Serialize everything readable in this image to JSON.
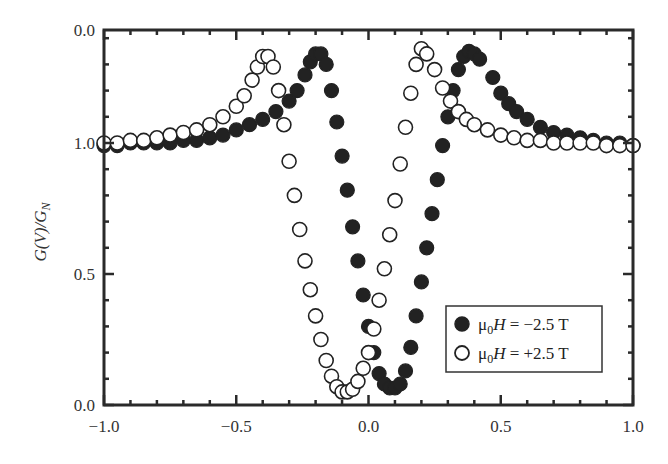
{
  "chart_data": {
    "type": "scatter",
    "title": "",
    "xlabel": "",
    "ylabel": "G(V)/G_N",
    "xlim": [
      -1.0,
      1.0
    ],
    "ylim": [
      0.0,
      1.43
    ],
    "grid": false,
    "legend_position": "lower right",
    "x_ticks": [
      {
        "value": -1.0,
        "label": "−1.0"
      },
      {
        "value": -0.5,
        "label": "−0.5"
      },
      {
        "value": 0.0,
        "label": "0.0"
      },
      {
        "value": 0.5,
        "label": "0.5"
      },
      {
        "value": 1.0,
        "label": "1.0"
      }
    ],
    "y_ticks": [
      {
        "value": 0.0,
        "label": "0.0"
      },
      {
        "value": 0.5,
        "label": "0.5"
      },
      {
        "value": 1.0,
        "label": "1.0"
      },
      {
        "value": 1.43,
        "label": "0.0"
      }
    ],
    "series": [
      {
        "name": "μ0H = −2.5 T",
        "marker": "filled-circle",
        "color": "#222222",
        "x": [
          -1.0,
          -0.95,
          -0.9,
          -0.85,
          -0.8,
          -0.75,
          -0.7,
          -0.65,
          -0.6,
          -0.55,
          -0.5,
          -0.45,
          -0.4,
          -0.35,
          -0.3,
          -0.27,
          -0.24,
          -0.22,
          -0.2,
          -0.18,
          -0.16,
          -0.14,
          -0.12,
          -0.1,
          -0.08,
          -0.06,
          -0.04,
          -0.02,
          0.0,
          0.02,
          0.04,
          0.06,
          0.08,
          0.1,
          0.12,
          0.14,
          0.16,
          0.18,
          0.2,
          0.22,
          0.24,
          0.26,
          0.28,
          0.3,
          0.32,
          0.34,
          0.36,
          0.38,
          0.4,
          0.42,
          0.47,
          0.5,
          0.53,
          0.56,
          0.6,
          0.65,
          0.7,
          0.75,
          0.8,
          0.85,
          0.9,
          0.95,
          1.0
        ],
        "y": [
          0.99,
          0.99,
          1.0,
          1.0,
          1.0,
          1.0,
          1.01,
          1.01,
          1.02,
          1.03,
          1.05,
          1.07,
          1.09,
          1.12,
          1.16,
          1.2,
          1.26,
          1.31,
          1.34,
          1.34,
          1.3,
          1.2,
          1.08,
          0.95,
          0.82,
          0.68,
          0.55,
          0.42,
          0.3,
          0.2,
          0.12,
          0.08,
          0.065,
          0.065,
          0.08,
          0.13,
          0.22,
          0.34,
          0.47,
          0.6,
          0.73,
          0.86,
          0.99,
          1.1,
          1.2,
          1.28,
          1.33,
          1.35,
          1.34,
          1.32,
          1.25,
          1.19,
          1.15,
          1.12,
          1.09,
          1.06,
          1.04,
          1.03,
          1.02,
          1.01,
          1.0,
          1.0,
          0.99
        ]
      },
      {
        "name": "μ0H = +2.5 T",
        "marker": "open-circle",
        "color": "#222222",
        "x": [
          -1.0,
          -0.95,
          -0.9,
          -0.85,
          -0.8,
          -0.75,
          -0.7,
          -0.65,
          -0.6,
          -0.55,
          -0.5,
          -0.47,
          -0.44,
          -0.42,
          -0.4,
          -0.38,
          -0.36,
          -0.34,
          -0.32,
          -0.3,
          -0.28,
          -0.26,
          -0.24,
          -0.22,
          -0.2,
          -0.18,
          -0.16,
          -0.14,
          -0.12,
          -0.1,
          -0.08,
          -0.06,
          -0.04,
          -0.02,
          0.0,
          0.02,
          0.04,
          0.06,
          0.08,
          0.1,
          0.12,
          0.14,
          0.16,
          0.18,
          0.2,
          0.22,
          0.25,
          0.28,
          0.31,
          0.34,
          0.37,
          0.4,
          0.45,
          0.5,
          0.55,
          0.6,
          0.65,
          0.7,
          0.75,
          0.8,
          0.85,
          0.9,
          0.95,
          1.0
        ],
        "y": [
          1.0,
          1.0,
          1.01,
          1.01,
          1.02,
          1.03,
          1.04,
          1.05,
          1.07,
          1.1,
          1.14,
          1.18,
          1.24,
          1.29,
          1.33,
          1.33,
          1.29,
          1.2,
          1.07,
          0.93,
          0.8,
          0.67,
          0.55,
          0.44,
          0.34,
          0.25,
          0.17,
          0.11,
          0.07,
          0.05,
          0.05,
          0.06,
          0.09,
          0.14,
          0.2,
          0.29,
          0.4,
          0.52,
          0.65,
          0.78,
          0.92,
          1.06,
          1.19,
          1.3,
          1.36,
          1.34,
          1.28,
          1.21,
          1.16,
          1.12,
          1.09,
          1.07,
          1.05,
          1.03,
          1.02,
          1.01,
          1.01,
          1.0,
          1.0,
          1.0,
          1.0,
          0.99,
          0.99,
          0.99
        ]
      }
    ]
  },
  "legend": {
    "entries": [
      {
        "marker": "filled-circle",
        "label_prefix": "μ",
        "label_sub": "0",
        "label_var": "H",
        "label_rest": " = −2.5 T"
      },
      {
        "marker": "open-circle",
        "label_prefix": "μ",
        "label_sub": "0",
        "label_var": "H",
        "label_rest": " = +2.5 T"
      }
    ]
  },
  "axes": {
    "ylabel_parts": {
      "g": "G(V)/G",
      "sub": "N"
    }
  }
}
